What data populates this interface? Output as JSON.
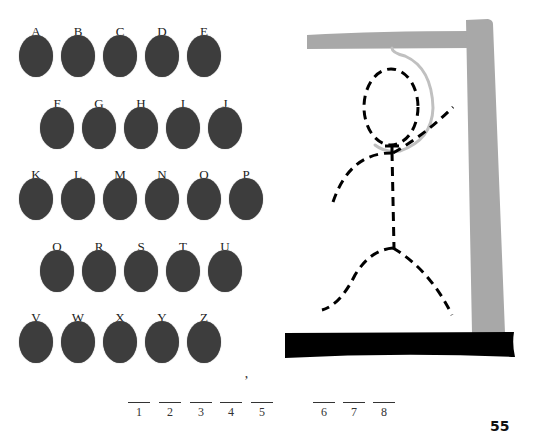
{
  "alphabet": {
    "rows": [
      {
        "offset": 19,
        "top": 25,
        "letters": [
          "A",
          "B",
          "C",
          "D",
          "E"
        ]
      },
      {
        "offset": 40,
        "top": 97,
        "letters": [
          "F",
          "G",
          "H",
          "I",
          "J"
        ]
      },
      {
        "offset": 19,
        "top": 168,
        "letters": [
          "K",
          "L",
          "M",
          "N",
          "O",
          "P"
        ]
      },
      {
        "offset": 40,
        "top": 240,
        "letters": [
          "Q",
          "R",
          "S",
          "T",
          "U"
        ]
      },
      {
        "offset": 19,
        "top": 311,
        "letters": [
          "V",
          "W",
          "X",
          "Y",
          "Z"
        ]
      }
    ],
    "disc_color": "#3d3d3d"
  },
  "puzzle": {
    "blanks": [
      {
        "num": "1",
        "x": 128
      },
      {
        "num": "2",
        "x": 159
      },
      {
        "num": "3",
        "x": 190
      },
      {
        "num": "4",
        "x": 220
      },
      {
        "num": "5",
        "x": 251
      },
      {
        "num": "6",
        "x": 313
      },
      {
        "num": "7",
        "x": 343
      },
      {
        "num": "8",
        "x": 373
      }
    ],
    "apostrophe": "’"
  },
  "gallows": {
    "post_color": "#a8a8a8",
    "base_color": "#000000",
    "rope_color": "#c0c0c0",
    "figure_color": "#000000"
  },
  "page": {
    "number": "55"
  }
}
